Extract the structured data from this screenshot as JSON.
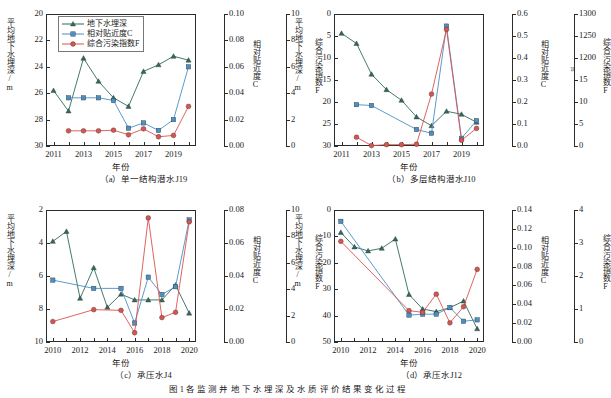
{
  "figure": {
    "caption": "图 1  各 监 测 井 地 下 水 埋 深 及 水 质 评 价 结 果 变 化 过 程",
    "colors": {
      "depth": "#2f6b5e",
      "closeness": "#4a90c4",
      "pollution": "#d9534f"
    }
  },
  "legend": {
    "items": [
      {
        "label": "地下水埋深",
        "marker": "triangle",
        "color": "#2f6b5e"
      },
      {
        "label": "相对贴近度C",
        "marker": "square",
        "color": "#4a90c4"
      },
      {
        "label": "综合污染指数F",
        "marker": "circle",
        "color": "#d9534f"
      }
    ]
  },
  "axis_titles": {
    "y_left": "平均地下水埋深/m",
    "y_right1": "相对贴近度C",
    "y_right2": "综合污染指数F",
    "x": "年份"
  },
  "chart_data": [
    {
      "id": "a",
      "type": "line",
      "title": "（a）单一结构潜水J19",
      "xlabel": "年份",
      "ylabel": "平均地下水埋深/m",
      "x": [
        2011,
        2012,
        2013,
        2014,
        2015,
        2016,
        2017,
        2018,
        2019,
        2020
      ],
      "xticks": [
        2011,
        2013,
        2015,
        2017,
        2019
      ],
      "xlim": [
        2010.5,
        2020.5
      ],
      "y_left": {
        "label": "平均地下水埋深/m",
        "ticks": [
          20,
          22,
          24,
          26,
          28,
          30
        ],
        "lim": [
          30,
          20
        ],
        "inverted": true
      },
      "y_right1": {
        "label": "相对贴近度C",
        "ticks": [
          0.0,
          0.02,
          0.04,
          0.06,
          0.08,
          0.1
        ],
        "lim": [
          0.0,
          0.1
        ]
      },
      "y_right2": {
        "label": "综合污染指数F",
        "ticks": [
          0,
          2,
          4,
          6,
          8,
          10
        ],
        "lim": [
          0,
          10
        ]
      },
      "series": [
        {
          "name": "地下水埋深",
          "axis": "left",
          "color": "#2f6b5e",
          "marker": "triangle",
          "values": [
            25.8,
            27.35,
            23.35,
            25.1,
            26.35,
            27.0,
            24.35,
            23.85,
            23.2,
            23.5
          ]
        },
        {
          "name": "相对贴近度C",
          "axis": "right1",
          "color": "#4a90c4",
          "marker": "square",
          "values": [
            null,
            0.0365,
            0.0365,
            0.0365,
            0.0345,
            0.0135,
            0.0175,
            0.0118,
            0.02,
            0.06
          ]
        },
        {
          "name": "综合污染指数F",
          "axis": "right2",
          "color": "#d9534f",
          "marker": "circle",
          "values": [
            null,
            1.15,
            1.15,
            1.15,
            1.2,
            0.85,
            1.3,
            0.7,
            0.8,
            3.0
          ]
        }
      ]
    },
    {
      "id": "b",
      "type": "line",
      "title": "（b）多层结构潜水J10",
      "xlabel": "年份",
      "ylabel": "平均地下水埋深/m",
      "x": [
        2011,
        2012,
        2013,
        2014,
        2015,
        2016,
        2017,
        2018,
        2019,
        2020
      ],
      "xticks": [
        2011,
        2013,
        2015,
        2017,
        2019
      ],
      "xlim": [
        2010.5,
        2020.5
      ],
      "y_left": {
        "label": "平均地下水埋深/m",
        "ticks": [
          0,
          5,
          10,
          15,
          20,
          25,
          30
        ],
        "lim": [
          30,
          0
        ],
        "inverted": true
      },
      "y_right1": {
        "label": "相对贴近度C",
        "ticks": [
          0.0,
          0.1,
          0.2,
          0.3,
          0.4,
          0.5,
          0.6
        ],
        "lim": [
          0.0,
          0.6
        ]
      },
      "y_right2": {
        "label": "综合污染指数F",
        "ticks": [
          0,
          5,
          10,
          15,
          1200,
          1250,
          1300
        ],
        "lim": [
          0,
          1300
        ],
        "broken": true,
        "break_after": 15
      },
      "series": [
        {
          "name": "地下水埋深",
          "axis": "left",
          "color": "#2f6b5e",
          "marker": "triangle",
          "values": [
            4.4,
            6.7,
            13.7,
            17.2,
            19.6,
            23.4,
            25.4,
            22.1,
            22.8,
            24.6
          ]
        },
        {
          "name": "相对贴近度C",
          "axis": "right1",
          "color": "#4a90c4",
          "marker": "square",
          "values": [
            null,
            0.188,
            0.184,
            null,
            null,
            0.075,
            0.058,
            0.545,
            0.035,
            0.115
          ]
        },
        {
          "name": "综合污染指数F",
          "axis": "right2",
          "color": "#d9534f",
          "marker": "circle",
          "values": [
            null,
            2.0,
            0.1,
            0.3,
            0.3,
            0.4,
            11.8,
            1265,
            1.3,
            4.0
          ]
        }
      ]
    },
    {
      "id": "c",
      "type": "line",
      "title": "（c）承压水J4",
      "xlabel": "年份",
      "ylabel": "平均地下水埋深/m",
      "x": [
        2010,
        2011,
        2012,
        2013,
        2014,
        2015,
        2016,
        2017,
        2018,
        2019,
        2020
      ],
      "xticks": [
        2010,
        2012,
        2014,
        2016,
        2018,
        2020
      ],
      "xlim": [
        2009.5,
        2020.5
      ],
      "y_left": {
        "label": "平均地下水埋深/m",
        "ticks": [
          2,
          4,
          6,
          8,
          10
        ],
        "lim": [
          10,
          2
        ],
        "inverted": true
      },
      "y_right1": {
        "label": "相对贴近度C",
        "ticks": [
          0.0,
          0.02,
          0.04,
          0.06,
          0.08
        ],
        "lim": [
          0.0,
          0.08
        ]
      },
      "y_right2": {
        "label": "综合污染指数F",
        "ticks": [
          0,
          2,
          4,
          6,
          8,
          10
        ],
        "lim": [
          0,
          10
        ]
      },
      "series": [
        {
          "name": "地下水埋深",
          "axis": "left",
          "color": "#2f6b5e",
          "marker": "triangle",
          "values": [
            3.9,
            3.3,
            7.35,
            5.5,
            7.9,
            7.1,
            7.45,
            7.45,
            7.45,
            6.55,
            8.25
          ]
        },
        {
          "name": "相对贴近度C",
          "axis": "right1",
          "color": "#4a90c4",
          "marker": "square",
          "values": [
            0.0375,
            null,
            null,
            0.0325,
            null,
            0.0325,
            0.0115,
            0.0393,
            0.0288,
            0.0335,
            0.074
          ]
        },
        {
          "name": "综合污染指数F",
          "axis": "right2",
          "color": "#d9534f",
          "marker": "circle",
          "values": [
            1.55,
            null,
            null,
            2.45,
            null,
            2.4,
            0.7,
            9.4,
            1.85,
            2.25,
            9.1
          ]
        }
      ]
    },
    {
      "id": "d",
      "type": "line",
      "title": "（d）承压水J12",
      "xlabel": "年份",
      "ylabel": "平均地下水埋深/m",
      "x": [
        2010,
        2011,
        2012,
        2013,
        2014,
        2015,
        2016,
        2017,
        2018,
        2019,
        2020
      ],
      "xticks": [
        2010,
        2012,
        2014,
        2016,
        2018,
        2020
      ],
      "xlim": [
        2009.5,
        2020.5
      ],
      "y_left": {
        "label": "平均地下水埋深/m",
        "ticks": [
          0,
          10,
          20,
          30,
          40,
          50
        ],
        "lim": [
          50,
          0
        ],
        "inverted": true
      },
      "y_right1": {
        "label": "相对贴近度C",
        "ticks": [
          0.0,
          0.02,
          0.04,
          0.06,
          0.08,
          0.1,
          0.12,
          0.14
        ],
        "lim": [
          0.0,
          0.14
        ]
      },
      "y_right2": {
        "label": "综合污染指数F",
        "ticks": [
          0,
          1,
          2,
          3,
          4
        ],
        "lim": [
          0,
          4
        ]
      },
      "series": [
        {
          "name": "地下水埋深",
          "axis": "left",
          "color": "#2f6b5e",
          "marker": "triangle",
          "values": [
            8.5,
            14.0,
            15.5,
            14.5,
            11.0,
            32.0,
            37.5,
            38.5,
            37.0,
            34.5,
            45.0
          ]
        },
        {
          "name": "相对贴近度C",
          "axis": "right1",
          "color": "#4a90c4",
          "marker": "square",
          "values": [
            0.128,
            null,
            null,
            null,
            null,
            0.0285,
            0.0295,
            0.0295,
            0.0365,
            0.022,
            0.0235
          ]
        },
        {
          "name": "综合污染指数F",
          "axis": "right2",
          "color": "#d9534f",
          "marker": "circle",
          "values": [
            3.05,
            null,
            null,
            null,
            null,
            0.95,
            0.9,
            1.45,
            0.58,
            1.07,
            2.2
          ]
        }
      ]
    }
  ]
}
